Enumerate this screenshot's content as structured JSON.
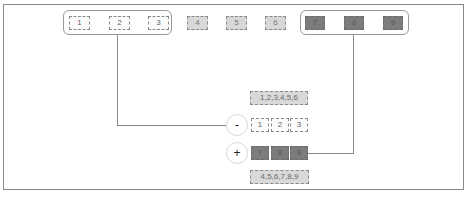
{
  "diagram": {
    "type": "set-operations",
    "colors": {
      "frame": "#8a8a8a",
      "group_border": "#9a9a9a",
      "set_a_fill": "#fbfbfb",
      "set_b_fill": "#d8d8d8",
      "set_c_fill": "#7c7c7c",
      "result_label_fill": "#d9d9d9",
      "connector": "#8a8a8a"
    },
    "top_row": {
      "left_group": [
        "1",
        "2",
        "3"
      ],
      "middle_items": [
        "4",
        "5",
        "6"
      ],
      "right_group": [
        "7",
        "8",
        "9"
      ]
    },
    "operations": [
      {
        "symbol": "-",
        "name": "difference",
        "result_label": "1,2,3,4,5,6",
        "items": [
          "1",
          "2",
          "3"
        ]
      },
      {
        "symbol": "+",
        "name": "union",
        "items": [
          "7",
          "8",
          "9"
        ],
        "result_label": "4,5,6,7,8,9"
      }
    ]
  }
}
